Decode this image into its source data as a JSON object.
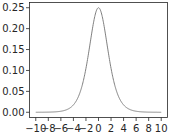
{
  "chart_data": {
    "type": "line",
    "title": "",
    "xlabel": "",
    "ylabel": "",
    "xlim": [
      -11,
      11
    ],
    "ylim": [
      -0.0125,
      0.2625
    ],
    "grid": false,
    "legend": null,
    "x_ticks": [
      -10,
      -8,
      -6,
      -4,
      -2,
      0,
      2,
      4,
      6,
      8,
      10
    ],
    "x_tick_labels": [
      "−10",
      "−8",
      "−6",
      "−4",
      "−2",
      "0",
      "2",
      "4",
      "6",
      "8",
      "10"
    ],
    "y_ticks": [
      0.0,
      0.05,
      0.1,
      0.15,
      0.2,
      0.25
    ],
    "y_tick_labels": [
      "0.00",
      "0.05",
      "0.10",
      "0.15",
      "0.20",
      "0.25"
    ],
    "series": [
      {
        "name": "logistic pdf",
        "color": "#808080",
        "x": [
          -10,
          -8,
          -6,
          -4,
          -3,
          -2,
          -1.5,
          -1,
          -0.5,
          0,
          0.5,
          1,
          1.5,
          2,
          3,
          4,
          6,
          8,
          10
        ],
        "y": [
          5e-05,
          0.00034,
          0.00246,
          0.0177,
          0.0452,
          0.105,
          0.149,
          0.197,
          0.235,
          0.25,
          0.235,
          0.197,
          0.149,
          0.105,
          0.0452,
          0.0177,
          0.00246,
          0.00034,
          5e-05
        ]
      }
    ]
  }
}
